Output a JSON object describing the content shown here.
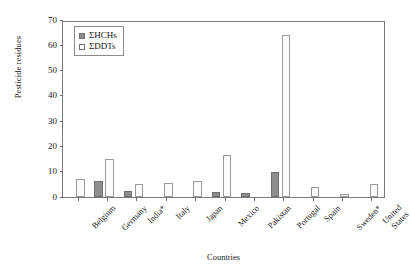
{
  "chart_data": {
    "type": "bar",
    "title": "",
    "xlabel": "Countries",
    "ylabel": "Pesticide residues",
    "ylim": [
      0,
      70
    ],
    "yticks": [
      0,
      10,
      20,
      30,
      40,
      50,
      60,
      70
    ],
    "grid": false,
    "legend_position": "top-left",
    "categories": [
      "Belgium",
      "Germany",
      "India*",
      "Italy",
      "Japan",
      "Mexico",
      "Pakistan",
      "Portugal",
      "Spain",
      "Sweden*",
      "United States"
    ],
    "series": [
      {
        "name": "ΣHCHs",
        "color": "#8e8e8e",
        "values": [
          0,
          6.5,
          2.5,
          0,
          0,
          2,
          1.7,
          10,
          0,
          0,
          0
        ]
      },
      {
        "name": "ΣDDTs",
        "color": "#fbfbfb",
        "values": [
          7,
          15.2,
          5,
          5.5,
          6.5,
          16.5,
          0,
          64,
          4,
          1,
          5
        ]
      }
    ]
  },
  "legend": {
    "items": [
      {
        "label": "ΣHCHs",
        "swatch": "filled-gray-square"
      },
      {
        "label": "ΣDDTs",
        "swatch": "open-white-square"
      }
    ]
  },
  "axes": {
    "y_title": "Pesticide residues",
    "x_title": "Countries",
    "y_tick_labels": [
      "70",
      "60",
      "50",
      "40",
      "30",
      "20",
      "10",
      "0"
    ],
    "x_tick_labels": [
      "Belgium",
      "Germany",
      "India*",
      "Italy",
      "Japan",
      "Mexico",
      "Pakistan",
      "Portugal",
      "Spain",
      "Sweden*",
      "United States"
    ]
  },
  "colors": {
    "hchs_fill": "#8e8e8e",
    "hchs_border": "#6f6f6f",
    "ddts_fill": "#fbfbfb",
    "ddts_border": "#9a9a9a",
    "axis": "#7a7a7a",
    "text": "#1a1a1a",
    "background": "#ffffff"
  }
}
